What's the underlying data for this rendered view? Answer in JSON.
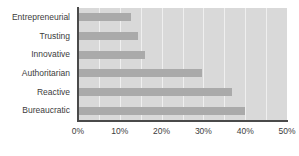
{
  "chart_data": {
    "type": "bar",
    "orientation": "horizontal",
    "title": "",
    "xlabel": "",
    "ylabel": "",
    "categories": [
      "Entrepreneurial",
      "Trusting",
      "Innovative",
      "Authoritarian",
      "Reactive",
      "Bureaucratic"
    ],
    "values": [
      12.7,
      14.4,
      16.0,
      29.7,
      36.8,
      40.0
    ],
    "xlim": [
      0,
      50
    ],
    "xtick_labels": [
      "0%",
      "10%",
      "20%",
      "30%",
      "40%",
      "50%"
    ],
    "xtick_values": [
      0,
      10,
      20,
      30,
      40,
      50
    ],
    "gridlines": [
      5,
      10,
      15,
      20,
      25,
      30,
      35,
      40,
      45
    ],
    "grid": true,
    "legend": "none",
    "colors": {
      "bar": "#aaaaaa",
      "plot_background": "#d9d9d9",
      "gridline": "#efefef",
      "axis": "#4a4a4a",
      "text": "#3c3c3c",
      "page_background": "#ffffff"
    }
  }
}
